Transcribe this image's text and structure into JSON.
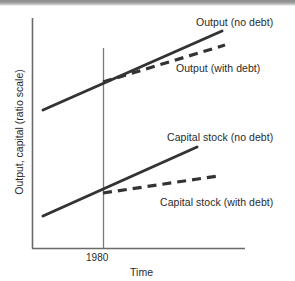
{
  "chart_data": {
    "type": "line",
    "title": "",
    "xlabel": "Time",
    "ylabel": "Output, capital (ratio scale)",
    "grid": false,
    "legend_position": "inline-annotations",
    "axis": {
      "x_ticks": [
        "1980"
      ],
      "y_ticks": [],
      "y_scale": "ratio (log)",
      "x_range_label": "Time",
      "reference_line_x": "1980"
    },
    "series": [
      {
        "name": "Output (no debt)",
        "style": "solid",
        "color": "#333333",
        "points": [
          [
            43,
            110
          ],
          [
            222,
            31
          ]
        ],
        "description": "Steady upward straight line on ratio scale, unaffected by 1980"
      },
      {
        "name": "Output (with debt)",
        "style": "dashed",
        "color": "#333333",
        "points": [
          [
            103,
            82
          ],
          [
            225,
            45
          ]
        ],
        "description": "Branches from the no-debt output path at 1980 with a flatter slope"
      },
      {
        "name": "Capital stock (no debt)",
        "style": "solid",
        "color": "#333333",
        "points": [
          [
            43,
            216
          ],
          [
            197,
            147
          ]
        ],
        "description": "Steady upward straight line on ratio scale, unaffected by 1980"
      },
      {
        "name": "Capital stock (with debt)",
        "style": "dashed",
        "color": "#333333",
        "points": [
          [
            103,
            193
          ],
          [
            218,
            176
          ]
        ],
        "description": "Branches from the no-debt capital path at 1980 with a much flatter slope"
      }
    ],
    "annotations": [
      {
        "text": "Output (no debt)",
        "x": 196,
        "y": 16
      },
      {
        "text": "Output (with debt)",
        "x": 176,
        "y": 62
      },
      {
        "text": "Capital stock (no debt)",
        "x": 167,
        "y": 131
      },
      {
        "text": "Capital stock (with debt)",
        "x": 160,
        "y": 196
      },
      {
        "text": "1980",
        "x": 86,
        "y": 252
      },
      {
        "text": "Time",
        "x": 130,
        "y": 266
      }
    ],
    "colors": {
      "line": "#333333",
      "axis": "#6a6a6a",
      "reference_line": "#7a7a7a",
      "text": "#2a2a2a",
      "background": "#ffffff"
    }
  },
  "labels": {
    "y_axis": "Output, capital (ratio scale)",
    "x_axis": "Time",
    "tick_1980": "1980",
    "output_no_debt": "Output (no debt)",
    "output_with_debt": "Output (with debt)",
    "capital_no_debt": "Capital stock (no debt)",
    "capital_with_debt": "Capital stock (with debt)"
  }
}
